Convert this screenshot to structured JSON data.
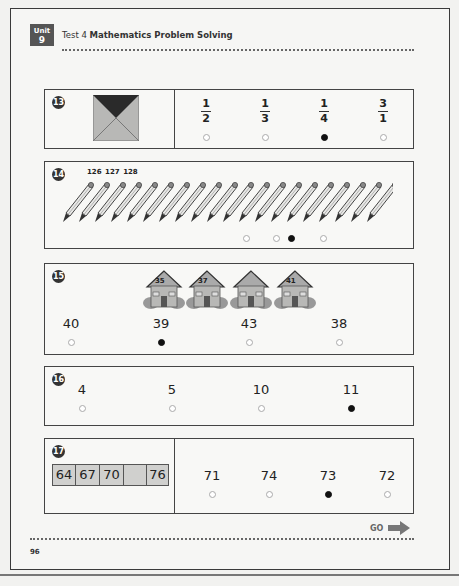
{
  "header": {
    "unit_label": "Unit",
    "unit_number": "9",
    "test_label": "Test 4",
    "subject": "Mathematics Problem Solving"
  },
  "questions": [
    {
      "number": "13",
      "figure": "square divided by diagonals, top triangle shaded dark",
      "options": [
        {
          "numerator": "1",
          "denominator": "2",
          "selected": false
        },
        {
          "numerator": "1",
          "denominator": "3",
          "selected": false
        },
        {
          "numerator": "1",
          "denominator": "4",
          "selected": true
        },
        {
          "numerator": "3",
          "denominator": "1",
          "selected": false
        }
      ]
    },
    {
      "number": "14",
      "figure": "row of pencils",
      "pencil_count": 20,
      "labels": [
        "126",
        "127",
        "128"
      ],
      "options": [
        {
          "selected": false
        },
        {
          "selected": false
        },
        {
          "selected": true
        },
        {
          "selected": false
        }
      ]
    },
    {
      "number": "15",
      "figure": "row of houses",
      "houses": [
        "35",
        "37",
        "",
        "41"
      ],
      "options": [
        {
          "label": "40",
          "selected": false
        },
        {
          "label": "39",
          "selected": true
        },
        {
          "label": "43",
          "selected": false
        },
        {
          "label": "38",
          "selected": false
        }
      ]
    },
    {
      "number": "16",
      "options": [
        {
          "label": "4",
          "selected": false
        },
        {
          "label": "5",
          "selected": false
        },
        {
          "label": "10",
          "selected": false
        },
        {
          "label": "11",
          "selected": true
        }
      ]
    },
    {
      "number": "17",
      "sequence": [
        "64",
        "67",
        "70",
        "",
        "76"
      ],
      "options": [
        {
          "label": "71",
          "selected": false
        },
        {
          "label": "74",
          "selected": false
        },
        {
          "label": "73",
          "selected": true
        },
        {
          "label": "72",
          "selected": false
        }
      ]
    }
  ],
  "footer": {
    "go_label": "GO",
    "page_number": "96"
  }
}
